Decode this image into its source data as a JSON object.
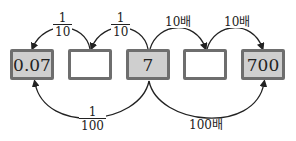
{
  "boxes": [
    {
      "value": "0.07",
      "filled": true
    },
    {
      "value": "",
      "filled": false
    },
    {
      "value": "7",
      "filled": true
    },
    {
      "value": "",
      "filled": false
    },
    {
      "value": "700",
      "filled": true
    }
  ],
  "labels": {
    "top_left_1": {
      "numerator": "1",
      "denominator": "10"
    },
    "top_left_2": {
      "numerator": "1",
      "denominator": "10"
    },
    "top_right_1": "10배",
    "top_right_2": "10배",
    "bottom_left": {
      "numerator": "1",
      "denominator": "100"
    },
    "bottom_right": "100배"
  },
  "colors": {
    "box_fill": "#cfcfcf",
    "box_border": "#6e6e6e",
    "arrow": "#222222"
  }
}
